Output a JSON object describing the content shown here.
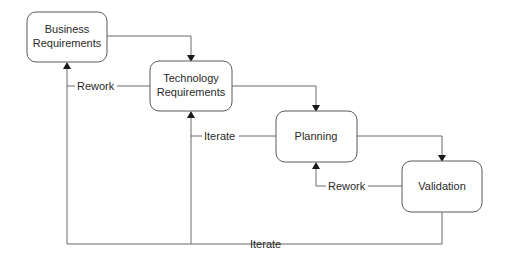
{
  "diagram": {
    "type": "process-flow",
    "nodes": [
      {
        "id": "business",
        "line1": "Business",
        "line2": "Requirements"
      },
      {
        "id": "technology",
        "line1": "Technology",
        "line2": "Requirements"
      },
      {
        "id": "planning",
        "label": "Planning"
      },
      {
        "id": "validation",
        "label": "Validation"
      }
    ],
    "edges": [
      {
        "from": "business",
        "to": "technology",
        "label": ""
      },
      {
        "from": "technology",
        "to": "planning",
        "label": ""
      },
      {
        "from": "planning",
        "to": "validation",
        "label": ""
      },
      {
        "from": "technology",
        "to": "business",
        "label": "Rework"
      },
      {
        "from": "planning",
        "to": "technology",
        "label": "Iterate"
      },
      {
        "from": "validation",
        "to": "planning",
        "label": "Rework"
      },
      {
        "from": "validation",
        "to": "business_and_technology",
        "label": "Iterate"
      }
    ],
    "colors": {
      "box_stroke": "#5a5a5a",
      "line": "#6b6b6b",
      "text": "#2a2a2a",
      "background": "#ffffff"
    }
  }
}
